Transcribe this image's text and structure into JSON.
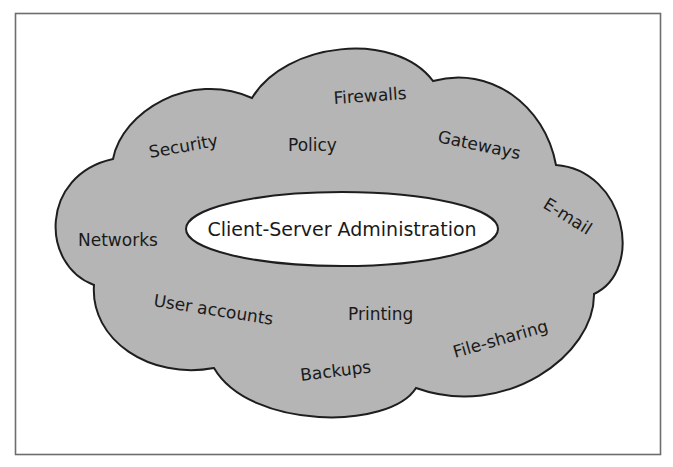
{
  "diagram": {
    "type": "concept-cloud",
    "center": {
      "label": "Client-Server Administration"
    },
    "topics": [
      {
        "id": "firewalls",
        "label": "Firewalls"
      },
      {
        "id": "security",
        "label": "Security"
      },
      {
        "id": "policy",
        "label": "Policy"
      },
      {
        "id": "gateways",
        "label": "Gateways"
      },
      {
        "id": "networks",
        "label": "Networks"
      },
      {
        "id": "email",
        "label": "E-mail"
      },
      {
        "id": "user-accounts",
        "label": "User accounts"
      },
      {
        "id": "printing",
        "label": "Printing"
      },
      {
        "id": "file-sharing",
        "label": "File-sharing"
      },
      {
        "id": "backups",
        "label": "Backups"
      }
    ],
    "colors": {
      "cloud_fill": "#b5b5b5",
      "outline": "#1e1e1e",
      "center_fill": "#ffffff",
      "frame": "#6d6d6d"
    }
  }
}
